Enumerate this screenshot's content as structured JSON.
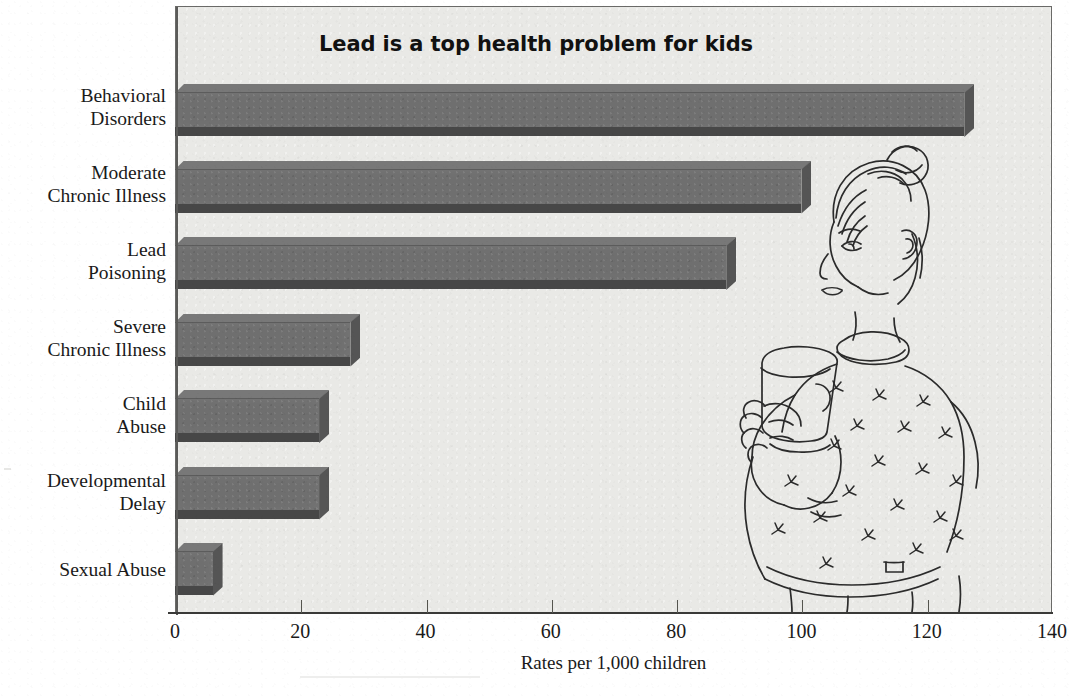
{
  "chart_data": {
    "type": "bar",
    "orientation": "horizontal",
    "title": "Lead is a top health problem for kids",
    "xlabel": "Rates per 1,000 children",
    "ylabel": "",
    "xlim": [
      0,
      140
    ],
    "xticks": [
      0,
      20,
      40,
      60,
      80,
      100,
      120,
      140
    ],
    "grid": false,
    "legend": null,
    "categories": [
      "Behavioral Disorders",
      "Moderate Chronic Illness",
      "Lead Poisoning",
      "Severe Chronic Illness",
      "Child Abuse",
      "Developmental Delay",
      "Sexual Abuse"
    ],
    "values": [
      126,
      100,
      88,
      28,
      23,
      23,
      6
    ],
    "bars": [
      {
        "label_line1": "Behavioral",
        "label_line2": "Disorders",
        "value": 126
      },
      {
        "label_line1": "Moderate",
        "label_line2": "Chronic Illness",
        "value": 100
      },
      {
        "label_line1": "Lead",
        "label_line2": "Poisoning",
        "value": 88
      },
      {
        "label_line1": "Severe",
        "label_line2": "Chronic Illness",
        "value": 28
      },
      {
        "label_line1": "Child",
        "label_line2": "Abuse",
        "value": 23
      },
      {
        "label_line1": "Developmental",
        "label_line2": "Delay",
        "value": 23
      },
      {
        "label_line1": "Sexual Abuse",
        "label_line2": "",
        "value": 6
      }
    ]
  },
  "illustration": {
    "name": "child-drinking-from-cup-illustration",
    "description": "Line drawing of a child with hair in a bun wearing a flower-patterned sweater, holding a cup"
  },
  "colors": {
    "bar_face": "#6f6f6f",
    "bar_top": "#787878",
    "bar_shadow": "#474747",
    "plot_background": "#e9e9e6",
    "frame_border": "#6a6a68",
    "text": "#1a1a1a"
  }
}
